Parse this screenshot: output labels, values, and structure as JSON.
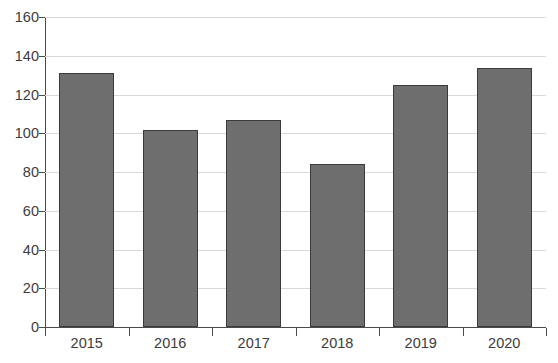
{
  "chart_data": {
    "type": "bar",
    "title": "",
    "title_visible": false,
    "title_note": "clipped at top edge of screenshot, illegible",
    "xlabel": "",
    "ylabel": "",
    "categories": [
      "2015",
      "2016",
      "2017",
      "2018",
      "2019",
      "2020"
    ],
    "values": [
      131,
      101.5,
      107,
      84,
      125,
      133.5
    ],
    "series": [
      {
        "name": "",
        "values": [
          131,
          101.5,
          107,
          84,
          125,
          133.5
        ]
      }
    ],
    "ylim": [
      0,
      160
    ],
    "ytick_labels": [
      "0",
      "20",
      "40",
      "60",
      "80",
      "100",
      "120",
      "140",
      "160"
    ],
    "ytick_values": [
      0,
      20,
      40,
      60,
      80,
      100,
      120,
      140,
      160
    ],
    "grid": {
      "horizontal": true,
      "vertical": false
    },
    "legend": {
      "visible": false,
      "position": "none"
    },
    "colors": {
      "bar_fill": "#6e6e6e",
      "bar_border": "#3b3b3b",
      "gridline": "#d9d9d9",
      "axis": "#4a4a4a",
      "text": "#3c3c3c",
      "background": "#ffffff"
    }
  }
}
